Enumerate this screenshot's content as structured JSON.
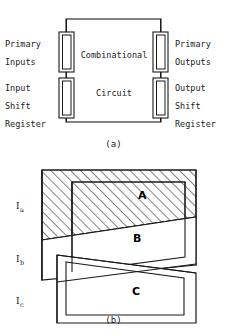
{
  "figure": {
    "panel_a": {
      "caption": "(a)",
      "center_labels": {
        "line1": "Combinational",
        "line2": "Circuit"
      },
      "left_labels": {
        "primary_inputs": [
          "Primary",
          "Inputs"
        ],
        "input_shift_register": [
          "Input",
          "Shift",
          "Register"
        ]
      },
      "right_labels": {
        "primary_outputs": [
          "Primary",
          "Outputs"
        ],
        "output_shift_register": [
          "Output",
          "Shift",
          "Register"
        ]
      },
      "registers": [
        {
          "name": "input-shift-register-upper",
          "x": 59,
          "y": 32,
          "w": 15,
          "h": 40
        },
        {
          "name": "input-shift-register-lower",
          "x": 59,
          "y": 78,
          "w": 15,
          "h": 40
        },
        {
          "name": "output-shift-register-upper",
          "x": 154,
          "y": 32,
          "w": 15,
          "h": 40
        },
        {
          "name": "output-shift-register-lower",
          "x": 154,
          "y": 78,
          "w": 15,
          "h": 40
        }
      ],
      "outer_box": {
        "x": 66,
        "y": 19,
        "w": 95,
        "h": 103
      }
    },
    "panel_b": {
      "caption": "(b)",
      "region_labels": [
        "A",
        "B",
        "C"
      ],
      "current_labels": [
        "I",
        "I",
        "I"
      ],
      "current_subscripts": [
        "a",
        "b",
        "c"
      ],
      "shapes": [
        {
          "name": "region-a-quad",
          "hatched": true,
          "points": "42,10 196,10 196,57 42,80"
        },
        {
          "name": "region-b-quad",
          "hatched": false,
          "points": "71,22 190,22 190,105 71,122"
        },
        {
          "name": "region-c-quad",
          "hatched": false,
          "points": "57,72 196,96 196,135 57,135"
        },
        {
          "name": "region-inner-quad",
          "hatched": false,
          "points": "66,25 166,25 166,100 66,110"
        }
      ]
    }
  },
  "colors": {
    "stroke": "#1a1a1a",
    "hatch": "#333333",
    "background": "#ffffff"
  }
}
